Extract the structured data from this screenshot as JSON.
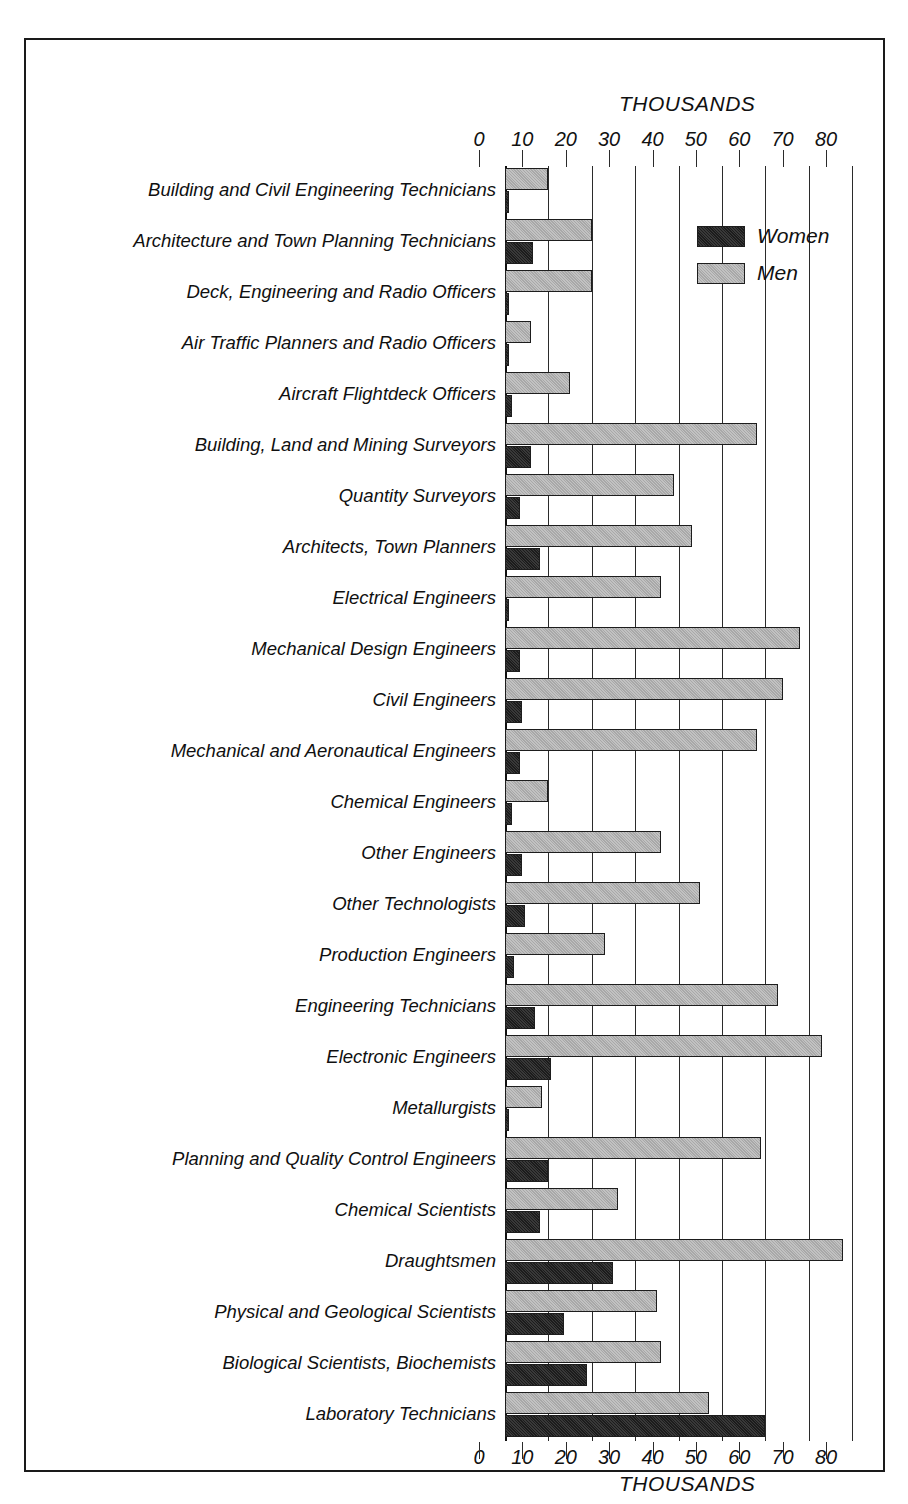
{
  "chart_data": {
    "type": "bar",
    "orientation": "horizontal",
    "title": "THOUSANDS",
    "subtitle": "",
    "xlabel": "THOUSANDS",
    "ylabel": "",
    "xlim": [
      0,
      80
    ],
    "xticks": [
      0,
      10,
      20,
      30,
      40,
      50,
      60,
      70,
      80
    ],
    "xtick_labels": [
      "0",
      "10",
      "20",
      "30",
      "40",
      "50",
      "60",
      "70",
      "80"
    ],
    "grid": true,
    "grid_axis": "x",
    "legend_position": "top-right",
    "units": "thousands",
    "categories": [
      "Building and Civil Engineering Technicians",
      "Architecture and Town Planning Technicians",
      "Deck, Engineering and Radio Officers",
      "Air Traffic Planners and Radio Officers",
      "Aircraft Flightdeck Officers",
      "Building, Land and Mining Surveyors",
      "Quantity Surveyors",
      "Architects, Town Planners",
      "Electrical Engineers",
      "Mechanical Design Engineers",
      "Civil Engineers",
      "Mechanical and Aeronautical Engineers",
      "Chemical Engineers",
      "Other Engineers",
      "Other Technologists",
      "Production Engineers",
      "Engineering Technicians",
      "Electronic Engineers",
      "Metallurgists",
      "Planning and Quality Control Engineers",
      "Chemical Scientists",
      "Draughtsmen",
      "Physical and Geological Scientists",
      "Biological Scientists, Biochemists",
      "Laboratory Technicians"
    ],
    "series": [
      {
        "name": "Women",
        "color": "#1c1c1c",
        "values": [
          1,
          6.5,
          1,
          1,
          1.5,
          6,
          3.5,
          8,
          1,
          3.5,
          4,
          3.5,
          1.5,
          4,
          4.5,
          2,
          7,
          10.5,
          1,
          10,
          8,
          25,
          13.5,
          19,
          60
        ]
      },
      {
        "name": "Men",
        "color": "#a8a8a8",
        "values": [
          10,
          20,
          20,
          6,
          15,
          58,
          39,
          43,
          36,
          68,
          64,
          58,
          10,
          36,
          45,
          23,
          63,
          73,
          8.5,
          59,
          26,
          78,
          35,
          36,
          47
        ]
      }
    ]
  },
  "legend": {
    "items": [
      {
        "label": "Women",
        "swatch": "women-swatch"
      },
      {
        "label": "Men",
        "swatch": "men-swatch"
      }
    ]
  }
}
